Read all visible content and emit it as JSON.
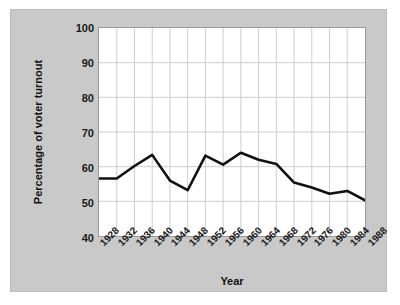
{
  "chart_data": {
    "type": "line",
    "title": "",
    "xlabel": "Year",
    "ylabel": "Percentage of voter turnout",
    "xlim": [
      1928,
      1988
    ],
    "ylim": [
      40,
      100
    ],
    "yticks": [
      40,
      50,
      60,
      70,
      80,
      90,
      100
    ],
    "xticks": [
      "1928",
      "1932",
      "1936",
      "1940",
      "1944",
      "1948",
      "1952",
      "1956",
      "1960",
      "1964",
      "1968",
      "1972",
      "1976",
      "1980",
      "1984",
      "1988"
    ],
    "grid": true,
    "legend": null,
    "series": [
      {
        "name": "Voter turnout",
        "color": "#111111",
        "x": [
          1928,
          1932,
          1936,
          1940,
          1944,
          1948,
          1952,
          1956,
          1960,
          1964,
          1968,
          1972,
          1976,
          1980,
          1984,
          1988
        ],
        "values": [
          56.6,
          56.6,
          60.2,
          63.4,
          56.0,
          53.2,
          63.2,
          60.6,
          64.0,
          62.0,
          60.8,
          55.4,
          54.0,
          52.2,
          53.0,
          50.3
        ]
      }
    ]
  },
  "axes": {
    "y_title": "Percentage of voter turnout",
    "x_title": "Year",
    "y_labels": [
      "100",
      "90",
      "80",
      "70",
      "60",
      "50",
      "40"
    ],
    "x_labels": [
      "1928",
      "1932",
      "1936",
      "1940",
      "1944",
      "1948",
      "1952",
      "1956",
      "1960",
      "1964",
      "1968",
      "1972",
      "1976",
      "1980",
      "1984",
      "1988"
    ]
  },
  "style": {
    "panel_background": "#c9c9c9",
    "plot_background": "#ffffff",
    "grid_color": "#cccccc",
    "line_color": "#111111",
    "axis_color": "#9a9a9a",
    "text_color": "#1a1a1a"
  }
}
